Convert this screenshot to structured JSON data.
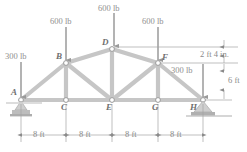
{
  "figure": {
    "type": "engineering-truss-diagram",
    "colors": {
      "member": "#c8c8c8",
      "member_edge": "#a9a9a9",
      "arrow": "#9a9a9a",
      "text": "#8a8a8a",
      "support": "#b5b5b5",
      "background": "#ffffff"
    }
  },
  "joints": [
    {
      "id": "A",
      "label": "A",
      "x": 21,
      "y": 100,
      "label_x": 11,
      "label_y": 88
    },
    {
      "id": "B",
      "label": "B",
      "x": 66,
      "y": 63,
      "label_x": 56,
      "label_y": 53
    },
    {
      "id": "C",
      "label": "C",
      "x": 66,
      "y": 100,
      "label_x": 61,
      "label_y": 104
    },
    {
      "id": "D",
      "label": "D",
      "x": 112,
      "y": 49,
      "label_x": 102,
      "label_y": 38
    },
    {
      "id": "E",
      "label": "E",
      "x": 112,
      "y": 100,
      "label_x": 107,
      "label_y": 104
    },
    {
      "id": "F",
      "label": "F",
      "x": 158,
      "y": 63,
      "label_x": 162,
      "label_y": 54
    },
    {
      "id": "G",
      "label": "G",
      "x": 158,
      "y": 100,
      "label_x": 153,
      "label_y": 104
    },
    {
      "id": "H",
      "label": "H",
      "x": 203,
      "y": 100,
      "label_x": 190,
      "label_y": 104
    }
  ],
  "members": [
    {
      "from": "A",
      "to": "B"
    },
    {
      "from": "B",
      "to": "D"
    },
    {
      "from": "D",
      "to": "F"
    },
    {
      "from": "F",
      "to": "H"
    },
    {
      "from": "A",
      "to": "C"
    },
    {
      "from": "C",
      "to": "E"
    },
    {
      "from": "E",
      "to": "G"
    },
    {
      "from": "G",
      "to": "H"
    },
    {
      "from": "B",
      "to": "C"
    },
    {
      "from": "D",
      "to": "E"
    },
    {
      "from": "F",
      "to": "G"
    },
    {
      "from": "B",
      "to": "E"
    },
    {
      "from": "E",
      "to": "F"
    }
  ],
  "loads": [
    {
      "id": "load-A",
      "label": "300 lb",
      "magnitude": 300,
      "unit": "lb",
      "at": "A",
      "x": 21,
      "tail_y": 62,
      "head_y": 98,
      "label_x": 5,
      "label_y": 52
    },
    {
      "id": "load-B",
      "label": "600 lb",
      "magnitude": 600,
      "unit": "lb",
      "at": "B",
      "x": 66,
      "tail_y": 27,
      "head_y": 61,
      "label_x": 50,
      "label_y": 17
    },
    {
      "id": "load-D",
      "label": "600 lb",
      "magnitude": 600,
      "unit": "lb",
      "at": "D",
      "x": 114,
      "tail_y": 13,
      "head_y": 47,
      "label_x": 98,
      "label_y": 4
    },
    {
      "id": "load-F",
      "label": "600 lb",
      "magnitude": 600,
      "unit": "lb",
      "at": "F",
      "x": 158,
      "tail_y": 27,
      "head_y": 61,
      "label_x": 142,
      "label_y": 17
    },
    {
      "id": "load-H",
      "label": "300 lb",
      "magnitude": 300,
      "unit": "lb",
      "at": "H",
      "x": 203,
      "tail_y": 64,
      "head_y": 98,
      "label_x": 171,
      "label_y": 66
    }
  ],
  "dimensions": {
    "horizontal": [
      {
        "id": "span-A-C",
        "label": "8 ft",
        "x_start": 21,
        "x_end": 66,
        "y": 135,
        "label_x": 33,
        "label_y": 129
      },
      {
        "id": "span-C-E",
        "label": "8 ft",
        "x_start": 66,
        "x_end": 112,
        "y": 135,
        "label_x": 79,
        "label_y": 129
      },
      {
        "id": "span-E-G",
        "label": "8 ft",
        "x_start": 112,
        "x_end": 158,
        "y": 135,
        "label_x": 125,
        "label_y": 129
      },
      {
        "id": "span-G-H",
        "label": "8 ft",
        "x_start": 158,
        "x_end": 203,
        "y": 135,
        "label_x": 170,
        "label_y": 129
      }
    ],
    "vertical": [
      {
        "id": "rise-D-F",
        "label": "2 ft 4 in.",
        "x": 212,
        "y_start": 45,
        "y_end": 63,
        "label_x": 205,
        "label_y": 51
      },
      {
        "id": "rise-F-H",
        "label": "6 ft",
        "x": 212,
        "y_start": 63,
        "y_end": 100,
        "label_x": 217,
        "label_y": 76
      }
    ]
  },
  "supports": [
    {
      "id": "support-A",
      "type": "pin-roller",
      "at": "A",
      "x": 21,
      "y": 100
    },
    {
      "id": "support-H",
      "type": "pin",
      "at": "H",
      "x": 203,
      "y": 100
    }
  ]
}
